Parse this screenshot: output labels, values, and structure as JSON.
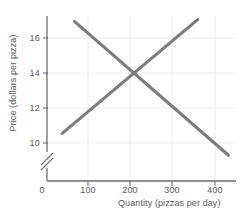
{
  "chart_data": {
    "type": "line",
    "title": "",
    "subtitle": "",
    "xlabel": "Quantity (pizzas per day)",
    "ylabel": "Price (dollars per pizza)",
    "xlim": [
      0,
      470
    ],
    "ylim": [
      9,
      17.4
    ],
    "y_axis_break": true,
    "y_axis_break_symbol": "//",
    "grid": true,
    "legend": "none",
    "xticks": [
      0,
      100,
      200,
      300,
      400
    ],
    "xtick_labels": [
      "0",
      "100",
      "200",
      "300",
      "400"
    ],
    "yticks": [
      10,
      12,
      14,
      16
    ],
    "ytick_labels": [
      "10",
      "12",
      "14",
      "16"
    ],
    "line_color": "#7c7c7e",
    "axis_color": "#6e6e70",
    "grid_color": "#ebebeb",
    "text_color": "#58585a",
    "equilibrium": {
      "quantity": 200,
      "price": 14
    },
    "series": [
      {
        "name": "Demand",
        "x": [
          65,
          430
        ],
        "y": [
          16.95,
          9.3
        ]
      },
      {
        "name": "Supply",
        "x": [
          36,
          357
        ],
        "y": [
          10.55,
          17.05
        ]
      }
    ]
  },
  "axes": {
    "x_title": "Quantity (pizzas per day)",
    "y_title": "Price (dollars per pizza)",
    "x_tick_labels": [
      "0",
      "100",
      "200",
      "300",
      "400"
    ],
    "y_tick_labels": [
      "16",
      "14",
      "12",
      "10"
    ],
    "origin_label": "0"
  }
}
